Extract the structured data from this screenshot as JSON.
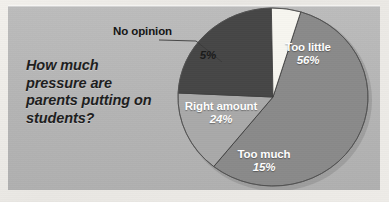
{
  "panel": {
    "background_color": "#b6b6b6",
    "page_background_color": "#eeece8"
  },
  "title": {
    "text": "How much pressure are parents putting on students?",
    "color": "#1d1d1d"
  },
  "callout": {
    "label": "No opinion"
  },
  "chart_data": {
    "type": "pie",
    "title": "How much pressure are parents putting on students?",
    "xlabel": "",
    "ylabel": "",
    "legend_position": "none",
    "grid": false,
    "categories": [
      "Too little",
      "Too much",
      "Right amount",
      "No opinion"
    ],
    "values": [
      56,
      15,
      24,
      5
    ],
    "value_suffix": "%",
    "slices": [
      {
        "label": "Too little",
        "value": 56,
        "value_label": "56%",
        "color": "#8a8a8a",
        "text_color": "#ffffff",
        "label_placement": "inside"
      },
      {
        "label": "Too much",
        "value": 15,
        "value_label": "15%",
        "color": "#a9a9a9",
        "text_color": "#ffffff",
        "label_placement": "inside"
      },
      {
        "label": "Right amount",
        "value": 24,
        "value_label": "24%",
        "color": "#464646",
        "text_color": "#ffffff",
        "label_placement": "inside"
      },
      {
        "label": "No opinion",
        "value": 5,
        "value_label": "5%",
        "color": "#f7f6f0",
        "text_color": "#1a1a1a",
        "label_placement": "outside-callout"
      }
    ]
  }
}
